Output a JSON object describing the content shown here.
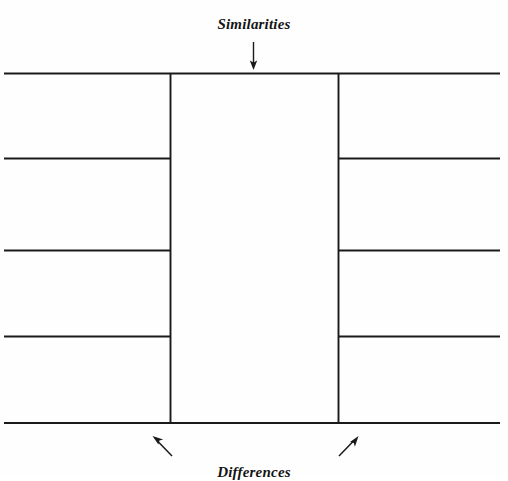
{
  "diagram": {
    "kind": "compare-contrast-graphic-organizer",
    "top_label": "Similarities",
    "bottom_label": "Differences",
    "line_color": "#1a1a1a",
    "background_color": "#fefefe",
    "text_color": "#141414",
    "arrows": {
      "similarities_arrow": "arrow-down",
      "left_differences_arrow": "arrow-up-left",
      "right_differences_arrow": "arrow-up-right"
    },
    "columns": [
      {
        "name": "left-column",
        "role": "differences-left",
        "cells": [
          "",
          "",
          "",
          ""
        ]
      },
      {
        "name": "middle-column",
        "role": "similarities",
        "cells": [
          ""
        ]
      },
      {
        "name": "right-column",
        "role": "differences-right",
        "cells": [
          "",
          "",
          "",
          ""
        ]
      }
    ],
    "geometry": {
      "box_top": 73,
      "box_bottom": 423,
      "box_left": 4,
      "box_right": 500,
      "vertical_left": 170,
      "vertical_right": 338,
      "row_dividers": [
        158,
        250,
        336
      ]
    }
  }
}
